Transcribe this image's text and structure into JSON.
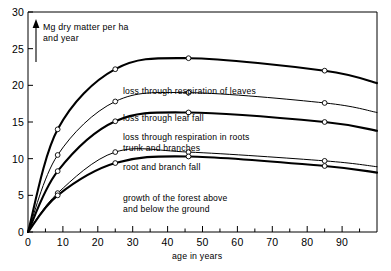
{
  "chart_data": {
    "type": "area",
    "title": "",
    "subtitle": "",
    "xlabel": "age in years",
    "ylabel": "Mg dry matter per ha and year",
    "xlim": [
      0,
      100
    ],
    "ylim": [
      0,
      30
    ],
    "xticks": [
      0,
      10,
      20,
      30,
      40,
      50,
      60,
      70,
      80,
      90
    ],
    "yticks": [
      0,
      5,
      10,
      15,
      20,
      25,
      30
    ],
    "xminorticks": [
      5,
      15,
      25,
      35,
      45,
      55,
      65,
      75,
      85,
      95
    ],
    "grid": false,
    "legend_position": "inline-annotations",
    "x": [
      0,
      8.5,
      25,
      46,
      85,
      100
    ],
    "series": [
      {
        "name": "loss through respiration of leaves",
        "values": [
          0,
          14.0,
          22.2,
          23.7,
          22.0,
          20.3
        ],
        "cumulative": true,
        "markers": true,
        "weight": "bold"
      },
      {
        "name": "loss through leaf fall",
        "values": [
          0,
          10.5,
          17.8,
          19.0,
          17.6,
          16.3
        ],
        "cumulative": true,
        "markers": true,
        "weight": "thin"
      },
      {
        "name": "loss through respiration in roots trunk and branches",
        "values": [
          0,
          8.3,
          15.1,
          16.3,
          15.0,
          13.8
        ],
        "cumulative": true,
        "markers": true,
        "weight": "bold"
      },
      {
        "name": "root and branch fall",
        "values": [
          0,
          5.3,
          10.9,
          10.9,
          9.7,
          8.9
        ],
        "cumulative": true,
        "markers": true,
        "weight": "thin"
      },
      {
        "name": "growth of the forest above and below the ground",
        "values": [
          0,
          5.0,
          9.4,
          10.3,
          9.0,
          8.1
        ],
        "cumulative": true,
        "markers": true,
        "weight": "bold"
      }
    ],
    "annotations": [
      {
        "text": "loss through  respiration of leaves",
        "x": 123,
        "y": 86
      },
      {
        "text": "loss through leaf fall",
        "x": 123,
        "y": 113
      },
      {
        "text": "loss through respiration in roots",
        "x": 123,
        "y": 132
      },
      {
        "text": "trunk and branches",
        "x": 123,
        "y": 142
      },
      {
        "text": "root and branch fall",
        "x": 123,
        "y": 162
      },
      {
        "text": "growth of the forest above",
        "x": 123,
        "y": 193
      },
      {
        "text": "and below the ground",
        "x": 123,
        "y": 204
      }
    ]
  },
  "axis": {
    "y_title_line1": "Mg dry matter per ha",
    "y_title_line2": "and year",
    "x_title": "age in years",
    "y_tick_labels": [
      "30",
      "25",
      "20",
      "15",
      "10",
      "5",
      "0"
    ],
    "x_tick_labels": [
      "0",
      "10",
      "20",
      "30",
      "40",
      "50",
      "60",
      "70",
      "80",
      "90"
    ]
  },
  "style": {
    "line_color": "#000000",
    "marker_fill": "#ffffff",
    "background": "#ffffff",
    "axis_color": "#000000"
  }
}
